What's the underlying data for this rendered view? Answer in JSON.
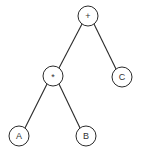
{
  "diagram": {
    "type": "expression-tree",
    "colors": {
      "stroke": "#2a2a2a",
      "fill": "#ffffff",
      "text": "#333333"
    },
    "nodes": [
      {
        "id": "plus",
        "label": "+",
        "x": 88,
        "y": 16
      },
      {
        "id": "times",
        "label": "*",
        "x": 53,
        "y": 76
      },
      {
        "id": "c",
        "label": "C",
        "x": 122,
        "y": 77
      },
      {
        "id": "a",
        "label": "A",
        "x": 19,
        "y": 136
      },
      {
        "id": "b",
        "label": "B",
        "x": 86,
        "y": 136
      }
    ],
    "edges": [
      {
        "from": "plus",
        "to": "times"
      },
      {
        "from": "plus",
        "to": "c"
      },
      {
        "from": "times",
        "to": "a"
      },
      {
        "from": "times",
        "to": "b"
      }
    ],
    "node_radius": 10
  }
}
